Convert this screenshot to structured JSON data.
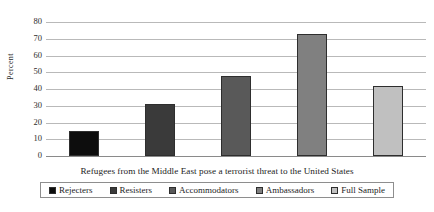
{
  "chart_data": {
    "type": "bar",
    "title": "",
    "subtitle": "",
    "xlabel": "Refugees from the Middle East pose a terrorist threat to the United States",
    "ylabel": "Percent",
    "ylim": [
      0,
      80
    ],
    "ytick_labels": [
      "0",
      "10",
      "20",
      "30",
      "40",
      "50",
      "60",
      "70",
      "80"
    ],
    "ytick_values": [
      0,
      10,
      20,
      30,
      40,
      50,
      60,
      70,
      80
    ],
    "grid": true,
    "legend_position": "bottom",
    "categories": [
      "Rejecters",
      "Resisters",
      "Accommodators",
      "Ambassadors",
      "Full Sample"
    ],
    "values": [
      15,
      31,
      48,
      73,
      42
    ],
    "colors": [
      "#0d0d0d",
      "#3a3a3a",
      "#595959",
      "#808080",
      "#c0c0c0"
    ],
    "bar_border_color": "#2e2e2e",
    "annotations": []
  },
  "legend": {
    "entries": [
      {
        "label": "Rejecters",
        "color": "#0d0d0d"
      },
      {
        "label": "Resisters",
        "color": "#3a3a3a"
      },
      {
        "label": "Accommodators",
        "color": "#595959"
      },
      {
        "label": "Ambassadors",
        "color": "#808080"
      },
      {
        "label": "Full Sample",
        "color": "#c0c0c0"
      }
    ]
  }
}
